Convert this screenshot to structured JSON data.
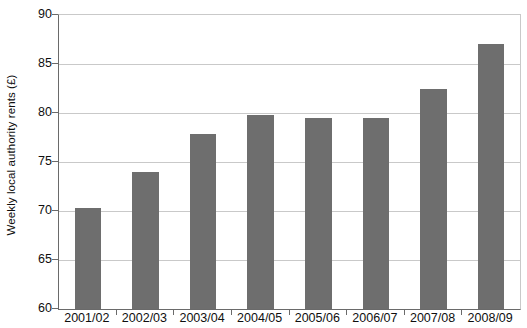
{
  "chart_data": {
    "type": "bar",
    "title": "",
    "subtitle": "",
    "xlabel": "",
    "ylabel": "Weekly local authority rents (£)",
    "categories": [
      "2001/02",
      "2002/03",
      "2003/04",
      "2004/05",
      "2005/06",
      "2006/07",
      "2007/08",
      "2008/09"
    ],
    "values": [
      70.3,
      74.0,
      77.9,
      79.8,
      79.5,
      79.5,
      82.5,
      87.0
    ],
    "ylim": [
      60,
      90
    ],
    "yticks": [
      60,
      65,
      70,
      75,
      80,
      85,
      90
    ],
    "ytick_labels": [
      "60",
      "65",
      "70",
      "75",
      "80",
      "85",
      "90"
    ],
    "grid": true,
    "legend": false,
    "legend_position": "none",
    "bar_color": "#6e6e6e",
    "grid_color": "#c9c9c9",
    "axis_color": "#6a6a6a",
    "background_color": "#ffffff"
  }
}
